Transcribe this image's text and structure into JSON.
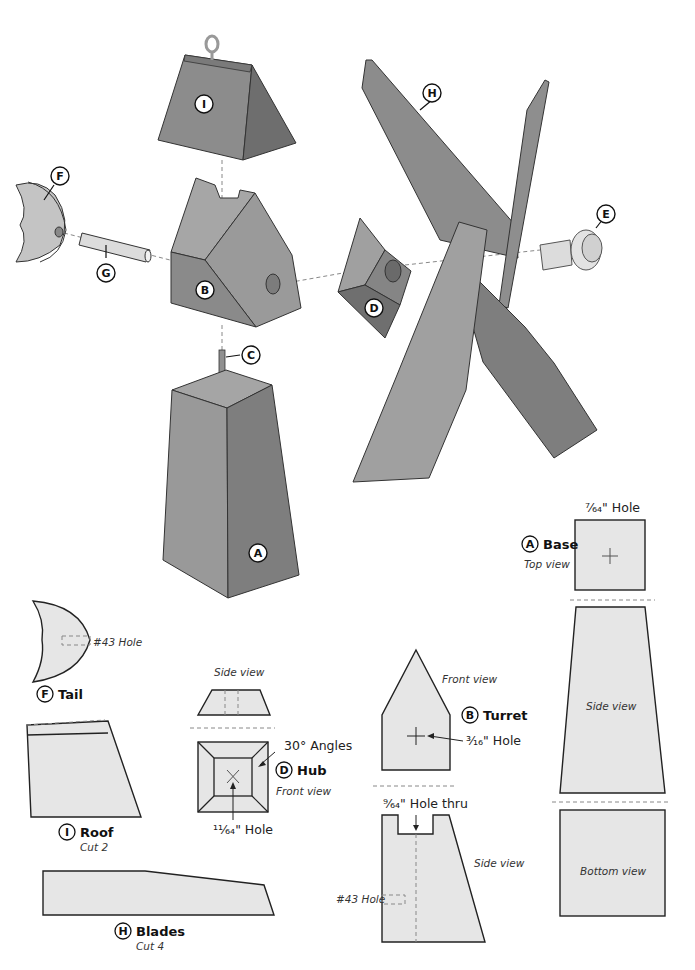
{
  "exploded_view": {
    "callouts": {
      "A": "A",
      "B": "B",
      "C": "C",
      "D": "D",
      "E": "E",
      "F": "F",
      "G": "G",
      "H": "H",
      "I": "I"
    }
  },
  "parts": {
    "tail": {
      "letter": "F",
      "name": "Tail",
      "hole_note": "#43 Hole"
    },
    "roof": {
      "letter": "I",
      "name": "Roof",
      "qty": "Cut 2"
    },
    "blades": {
      "letter": "H",
      "name": "Blades",
      "qty": "Cut 4"
    },
    "hub": {
      "letter": "D",
      "name": "Hub",
      "side_view": "Side view",
      "front_view": "Front view",
      "angle_note": "30° Angles",
      "hole_note": "¹¹⁄₆₄\" Hole"
    },
    "turret": {
      "letter": "B",
      "name": "Turret",
      "front_view": "Front view",
      "side_view": "Side view",
      "front_hole": "³⁄₁₆\" Hole",
      "top_hole": "⁹⁄₆₄\" Hole thru",
      "side_hole": "#43 Hole"
    },
    "base": {
      "letter": "A",
      "name": "Base",
      "top_view": "Top view",
      "side_view": "Side view",
      "bottom_view": "Bottom view",
      "top_hole": "⁷⁄₆₄\" Hole"
    }
  },
  "colors": {
    "part_light": "#a9a9a9",
    "part_mid": "#8c8c8c",
    "part_dark": "#6e6e6e",
    "flat_fill": "#e6e6e6",
    "outline": "#222222"
  }
}
